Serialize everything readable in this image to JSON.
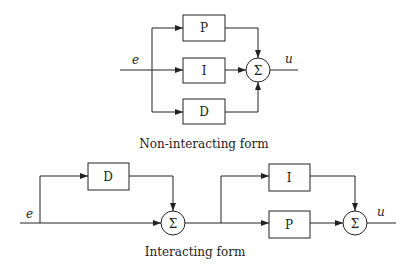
{
  "top_diagram": {
    "caption": "Non-interacting form",
    "input_label": "e",
    "output_label": "u",
    "blocks": [
      {
        "label": "P"
      },
      {
        "label": "I"
      },
      {
        "label": "D"
      }
    ],
    "sum_label": "Σ"
  },
  "bottom_diagram": {
    "caption": "Interacting form",
    "input_label": "e",
    "output_label": "u",
    "blocks": [
      {
        "label": "D"
      },
      {
        "label": "I"
      },
      {
        "label": "P"
      }
    ],
    "sum1_label": "Σ",
    "sum2_label": "Σ"
  }
}
